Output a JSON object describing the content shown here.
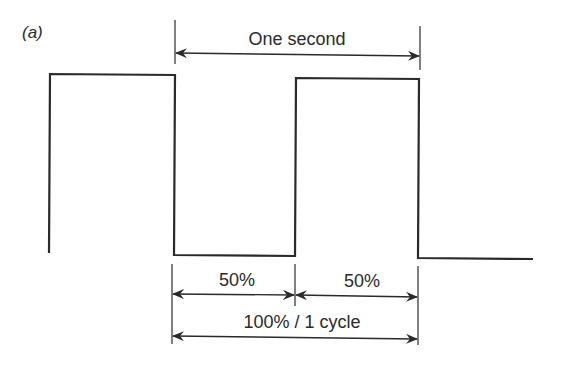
{
  "figure": {
    "panel_label": "(a)",
    "labels": {
      "period": "One second",
      "high_duty": "50%",
      "low_duty": "50%",
      "full_cycle": "100% / 1 cycle"
    },
    "colors": {
      "line": "#2a2a2a",
      "background": "#ffffff"
    }
  },
  "waveform": {
    "type": "square-wave",
    "duty_cycle_percent": 50,
    "period_seconds": 1,
    "points": [
      [
        49,
        253
      ],
      [
        50,
        74
      ],
      [
        175,
        75
      ],
      [
        174,
        255
      ],
      [
        295,
        256
      ],
      [
        296,
        78
      ],
      [
        419,
        79
      ],
      [
        418,
        258
      ],
      [
        533,
        259
      ]
    ]
  }
}
